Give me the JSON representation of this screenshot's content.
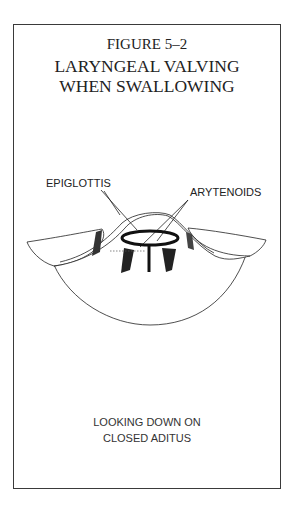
{
  "figure": {
    "number": "FIGURE 5–2",
    "title_line1": "LARYNGEAL VALVING",
    "title_line2": "WHEN SWALLOWING"
  },
  "labels": {
    "epiglottis": "EPIGLOTTIS",
    "arytenoids": "ARYTENOIDS"
  },
  "caption": {
    "line1": "LOOKING DOWN ON",
    "line2": "CLOSED ADITUS"
  }
}
